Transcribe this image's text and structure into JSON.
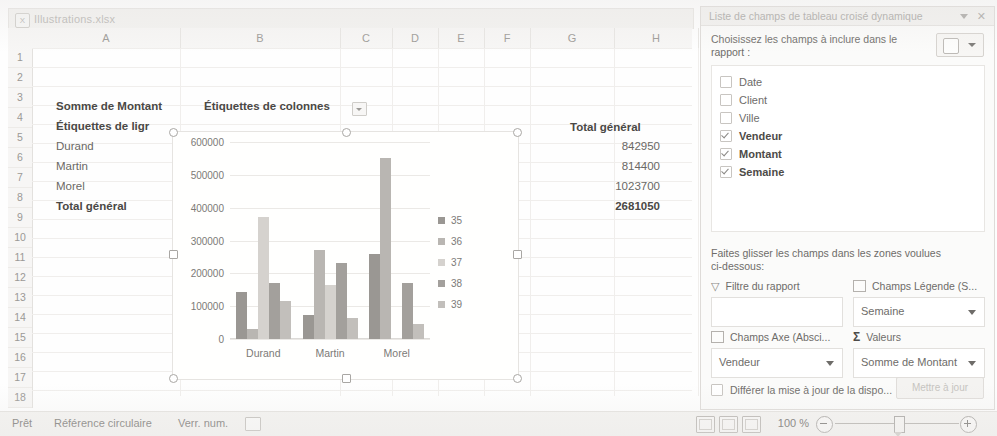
{
  "window": {
    "file_name": "Illustrations.xlsx",
    "file_icon": "excel-workbook-icon"
  },
  "sheet": {
    "column_headers": [
      "A",
      "B",
      "C",
      "D",
      "E",
      "F",
      "G",
      "H"
    ],
    "row_headers": [
      "1",
      "2",
      "3",
      "4",
      "5",
      "6",
      "7",
      "8",
      "9",
      "10",
      "11",
      "12",
      "13",
      "14",
      "15",
      "16",
      "17",
      "18"
    ],
    "pivot": {
      "value_field_label": "Somme de Montant",
      "column_labels_header": "Étiquettes de colonnes",
      "row_labels_header": "Étiquettes de ligr",
      "grand_total_header": "Total général",
      "rows": [
        {
          "label": "Durand",
          "total": "842950"
        },
        {
          "label": "Martin",
          "total": "814400"
        },
        {
          "label": "Morel",
          "total": "1023700"
        }
      ],
      "grand_total_label": "Total général",
      "grand_total_value": "2681050"
    }
  },
  "chart_data": {
    "type": "bar",
    "title": "",
    "xlabel": "",
    "ylabel": "",
    "categories": [
      "Durand",
      "Martin",
      "Morel"
    ],
    "ytick_labels": [
      "0",
      "100000",
      "200000",
      "300000",
      "400000",
      "500000",
      "600000"
    ],
    "yticks": [
      0,
      100000,
      200000,
      300000,
      400000,
      500000,
      600000
    ],
    "ylim": [
      0,
      600000
    ],
    "grid": true,
    "legend_position": "right",
    "series": [
      {
        "name": "35",
        "color": "#9a9793",
        "values": [
          143000,
          73000,
          258000
        ]
      },
      {
        "name": "36",
        "color": "#b9b6b2",
        "values": [
          30000,
          270000,
          552000
        ]
      },
      {
        "name": "37",
        "color": "#d5d2ce",
        "values": [
          372000,
          165000,
          0
        ]
      },
      {
        "name": "38",
        "color": "#a3a09c",
        "values": [
          170000,
          232000,
          170000
        ]
      },
      {
        "name": "39",
        "color": "#c2bfbb",
        "values": [
          115000,
          65000,
          45000
        ]
      }
    ]
  },
  "pane": {
    "title": "Liste de champs de tableau croisé dynamique",
    "caret_icon": "chevron-down-icon",
    "close_icon": "close-icon",
    "subtitle": "Choisissez les champs à inclure dans le rapport :",
    "tool_icon": "field-list-layout-icon",
    "tool_caret_icon": "chevron-down-icon",
    "fields": [
      {
        "label": "Date",
        "checked": false
      },
      {
        "label": "Client",
        "checked": false
      },
      {
        "label": "Ville",
        "checked": false
      },
      {
        "label": "Vendeur",
        "checked": true
      },
      {
        "label": "Montant",
        "checked": true
      },
      {
        "label": "Semaine",
        "checked": true
      }
    ],
    "drag_instruction": "Faites glisser les champs dans les zones voulues ci-dessous:",
    "zones": [
      {
        "id": "report-filter",
        "icon": "filter-icon",
        "header": "Filtre du rapport",
        "value": ""
      },
      {
        "id": "legend-fields",
        "icon": "legend-icon",
        "header": "Champs Légende (S...",
        "value": "Semaine"
      },
      {
        "id": "axis-fields",
        "icon": "axis-icon",
        "header": "Champs Axe (Absci...",
        "value": "Vendeur"
      },
      {
        "id": "values",
        "icon": "sigma-icon",
        "header": "Valeurs",
        "value": "Somme de Montant"
      }
    ],
    "defer_label": "Différer la mise à jour de la dispo...",
    "defer_checked": false,
    "update_button_label": "Mettre à jour"
  },
  "status_bar": {
    "state": "Prêt",
    "circular_reference": "Référence circulaire",
    "num_lock": "Verr. num.",
    "record_icon": "record-macro-icon",
    "view_buttons": [
      "normal-view-icon",
      "page-layout-icon",
      "page-break-preview-icon"
    ],
    "zoom_level": "100 %",
    "zoom_out_icon": "zoom-out-icon",
    "zoom_in_icon": "zoom-in-icon"
  }
}
